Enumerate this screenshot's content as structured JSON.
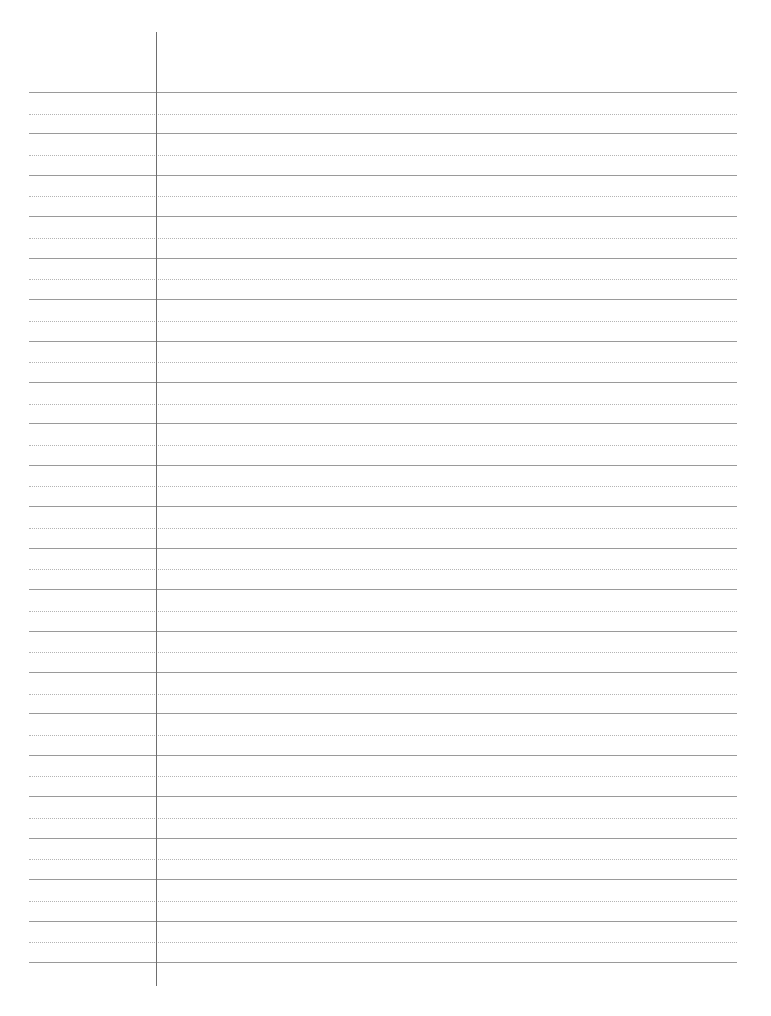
{
  "page": {
    "type": "lined-paper",
    "width": 771,
    "height": 1016,
    "background": "#ffffff"
  },
  "rules": {
    "left": 29,
    "right": 737,
    "first_solid_y": 92,
    "spacing": 41.43,
    "solid_count": 22,
    "dotted_offset": 21.5,
    "solid_color": "#9a9a9a",
    "dotted_color": "#b4b4b4"
  },
  "margin_line": {
    "x": 156,
    "top": 32,
    "bottom": 986,
    "color": "#6e6e6e"
  }
}
